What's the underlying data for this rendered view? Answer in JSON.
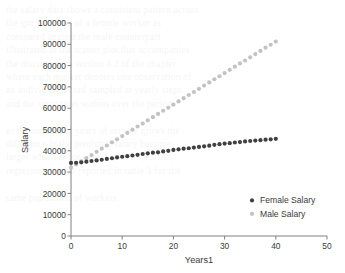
{
  "chart_data": {
    "type": "scatter",
    "title": "",
    "xlabel": "Years1",
    "ylabel": "Salary",
    "xlim": [
      0,
      50
    ],
    "ylim": [
      0,
      100000
    ],
    "xticks": [
      "0",
      "10",
      "20",
      "30",
      "40",
      "50"
    ],
    "xtick_values": [
      0,
      10,
      20,
      30,
      40,
      50
    ],
    "yticks": [
      "0",
      "10000",
      "20000",
      "30000",
      "40000",
      "50000",
      "60000",
      "70000",
      "80000",
      "90000",
      "100000"
    ],
    "ytick_values": [
      0,
      10000,
      20000,
      30000,
      40000,
      50000,
      60000,
      70000,
      80000,
      90000,
      100000
    ],
    "grid": false,
    "legend_position": "lower-right",
    "series": [
      {
        "name": "Female Salary",
        "color": "#404040",
        "marker": "circle",
        "x": [
          0,
          1,
          2,
          3,
          4,
          5,
          6,
          7,
          8,
          9,
          10,
          11,
          12,
          13,
          14,
          15,
          16,
          17,
          18,
          19,
          20,
          21,
          22,
          23,
          24,
          25,
          26,
          27,
          28,
          29,
          30,
          31,
          32,
          33,
          34,
          35,
          36,
          37,
          38,
          39,
          40
        ],
        "values": [
          34300,
          34400,
          34600,
          34900,
          35200,
          35500,
          35800,
          36200,
          36500,
          36900,
          37200,
          37500,
          37800,
          38100,
          38500,
          38800,
          39100,
          39300,
          39700,
          40000,
          40400,
          40700,
          41000,
          41200,
          41500,
          41800,
          42100,
          42400,
          42800,
          43100,
          43400,
          43600,
          43900,
          44100,
          44400,
          44600,
          44800,
          45000,
          45200,
          45400,
          45600
        ]
      },
      {
        "name": "Male Salary",
        "color": "#c3c3c3",
        "marker": "circle",
        "x": [
          0,
          1,
          2,
          3,
          4,
          5,
          6,
          7,
          8,
          9,
          10,
          11,
          12,
          13,
          14,
          15,
          16,
          17,
          18,
          19,
          20,
          21,
          22,
          23,
          24,
          25,
          26,
          27,
          28,
          29,
          30,
          31,
          32,
          33,
          34,
          35,
          36,
          37,
          38,
          39,
          40
        ],
        "values": [
          32100,
          33600,
          35100,
          36600,
          38000,
          39500,
          41000,
          42500,
          44000,
          45400,
          46900,
          48400,
          49900,
          51400,
          52800,
          54300,
          55800,
          57300,
          58800,
          60200,
          61700,
          63200,
          64700,
          66200,
          67600,
          69100,
          70600,
          72100,
          73600,
          75000,
          76500,
          78000,
          79500,
          81000,
          82400,
          83900,
          85400,
          86900,
          88400,
          89800,
          91300
        ]
      }
    ]
  },
  "legend": {
    "items": [
      {
        "label": "Female Salary",
        "color": "#404040"
      },
      {
        "label": "Male Salary",
        "color": "#c3c3c3"
      }
    ]
  },
  "background_page": {
    "note": "faint show-through text from reverse of scanned page",
    "lines": [
      "the salary data shows a consistent pattern across",
      "the growth trend of a female worker as",
      "compared against the male counterpart",
      "illustrated in the scatter plot that accompanies",
      "the discussion in section 4.2 of the chapter",
      "where each marker denotes one observation of",
      "an individual record sampled at yearly steps",
      "and the separation widens over the period",
      "",
      "as the number of years of service grows the",
      "difference in the predicted salary becomes",
      "larger which is consistent with the earlier",
      "regression results reported in table 3 for the",
      "",
      "same population of workers"
    ]
  }
}
